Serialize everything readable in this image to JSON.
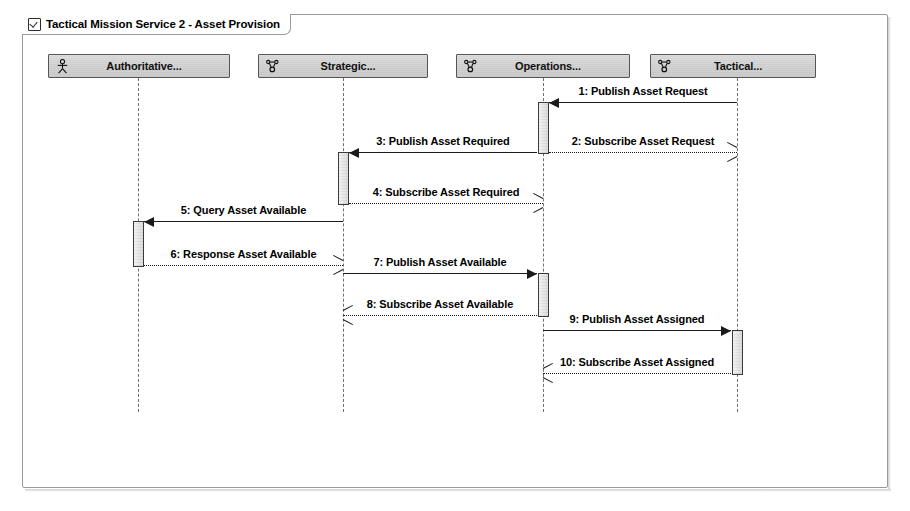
{
  "frame": {
    "title": "Tactical Mission Service 2 - Asset Provision",
    "icon": "checkbox-checked-icon"
  },
  "lifelines": [
    {
      "id": "authoritative",
      "label": "Authoritative...",
      "icon": "actor-icon",
      "x": 138,
      "head_left": 48,
      "head_width": 182
    },
    {
      "id": "strategic",
      "label": "Strategic...",
      "icon": "collaboration-icon",
      "x": 343,
      "head_left": 258,
      "head_width": 170
    },
    {
      "id": "operations",
      "label": "Operations...",
      "icon": "collaboration-icon",
      "x": 543,
      "head_left": 456,
      "head_width": 174
    },
    {
      "id": "tactical",
      "label": "Tactical...",
      "icon": "collaboration-icon",
      "x": 737,
      "head_left": 650,
      "head_width": 166
    }
  ],
  "messages": [
    {
      "num": "1",
      "text": "1: Publish Asset Request",
      "from": "tactical",
      "to": "operations",
      "style": "solid",
      "arrow": "filled",
      "direction": "left",
      "y": 102
    },
    {
      "num": "2",
      "text": "2: Subscribe Asset Request",
      "from": "operations",
      "to": "tactical",
      "style": "dashed",
      "arrow": "open",
      "direction": "right",
      "y": 152
    },
    {
      "num": "3",
      "text": "3: Publish Asset Required",
      "from": "operations",
      "to": "strategic",
      "style": "solid",
      "arrow": "filled",
      "direction": "left",
      "y": 152
    },
    {
      "num": "4",
      "text": "4: Subscribe Asset Required",
      "from": "strategic",
      "to": "operations",
      "style": "dashed",
      "arrow": "open",
      "direction": "right",
      "y": 203
    },
    {
      "num": "5",
      "text": "5: Query Asset Available",
      "from": "strategic",
      "to": "authoritative",
      "style": "solid",
      "arrow": "filled",
      "direction": "left",
      "y": 221
    },
    {
      "num": "6",
      "text": "6: Response Asset Available",
      "from": "authoritative",
      "to": "strategic",
      "style": "dashed",
      "arrow": "open",
      "direction": "right",
      "y": 265
    },
    {
      "num": "7",
      "text": "7: Publish Asset Available",
      "from": "strategic",
      "to": "operations",
      "style": "solid",
      "arrow": "filled",
      "direction": "right",
      "y": 273
    },
    {
      "num": "8",
      "text": "8: Subscribe Asset Available",
      "from": "operations",
      "to": "strategic",
      "style": "dashed",
      "arrow": "open",
      "direction": "left",
      "y": 315
    },
    {
      "num": "9",
      "text": "9: Publish Asset Assigned",
      "from": "operations",
      "to": "tactical",
      "style": "solid",
      "arrow": "filled",
      "direction": "right",
      "y": 330
    },
    {
      "num": "10",
      "text": "10: Subscribe Asset Assigned",
      "from": "tactical",
      "to": "operations",
      "style": "dashed",
      "arrow": "open",
      "direction": "left",
      "y": 373
    }
  ],
  "activations": [
    {
      "lifeline": "operations",
      "top": 102,
      "height": 52
    },
    {
      "lifeline": "strategic",
      "top": 152,
      "height": 53
    },
    {
      "lifeline": "authoritative",
      "top": 221,
      "height": 46
    },
    {
      "lifeline": "operations",
      "top": 273,
      "height": 44
    },
    {
      "lifeline": "tactical",
      "top": 330,
      "height": 45
    }
  ],
  "geometry": {
    "lifeline_top": 78,
    "lifeline_bottom": 412,
    "head_top": 54
  }
}
